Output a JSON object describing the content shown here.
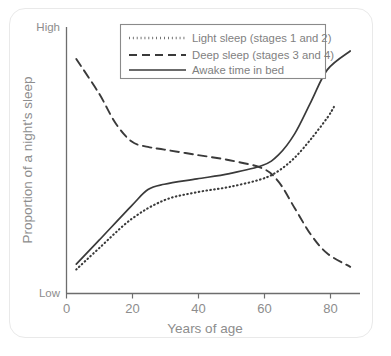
{
  "chart_data": {
    "type": "line",
    "title": "",
    "subtitle": "",
    "xlabel": "Years of age",
    "ylabel": "Proportion of a night's sleep",
    "xlim": [
      0,
      90
    ],
    "ylim": [
      0,
      100
    ],
    "grid": false,
    "legend_position": "top-center",
    "x_tick_labels": [
      "0",
      "20",
      "40",
      "60",
      "80"
    ],
    "x_tick_values": [
      0,
      20,
      40,
      60,
      80
    ],
    "y_tick_labels": [
      "Low",
      "High"
    ],
    "y_tick_values": [
      0,
      100
    ],
    "y_axis_note": "Qualitative axis labelled only Low (bottom) and High (top)",
    "series": [
      {
        "name": "Light sleep (stages 1 and 2)",
        "style": "dotted",
        "color": "#3a3a3a",
        "x": [
          3,
          10,
          20,
          30,
          40,
          50,
          60,
          65,
          70,
          75,
          80,
          82
        ],
        "values": [
          9,
          17,
          28,
          35,
          38,
          40,
          43,
          46,
          51,
          58,
          66,
          70
        ]
      },
      {
        "name": "Deep sleep (stages 3 and 4)",
        "style": "dashed",
        "color": "#3a3a3a",
        "x": [
          3,
          10,
          15,
          20,
          25,
          30,
          40,
          50,
          60,
          65,
          70,
          75,
          80,
          87
        ],
        "values": [
          88,
          75,
          64,
          57,
          55,
          54,
          52,
          50,
          47,
          42,
          32,
          22,
          15,
          10
        ]
      },
      {
        "name": "Awake time in bed",
        "style": "solid",
        "color": "#3a3a3a",
        "x": [
          3,
          10,
          20,
          25,
          30,
          40,
          50,
          60,
          65,
          70,
          75,
          80,
          87
        ],
        "values": [
          11,
          20,
          33,
          39,
          41,
          43,
          45,
          48,
          52,
          60,
          72,
          84,
          91
        ]
      }
    ]
  },
  "axes": {
    "y_top_label": "High",
    "y_bottom_label": "Low",
    "y_title": "Proportion of a night's sleep",
    "x_title": "Years of age",
    "x_ticks": [
      "0",
      "20",
      "40",
      "60",
      "80"
    ]
  },
  "legend": {
    "entries": [
      {
        "label": "Light sleep (stages 1 and 2)",
        "style": "dotted"
      },
      {
        "label": "Deep sleep (stages 3 and 4)",
        "style": "dashed"
      },
      {
        "label": "Awake time in bed",
        "style": "solid"
      }
    ]
  },
  "colors": {
    "line": "#3a3a3a",
    "axis": "#6d6d6d",
    "text": "#8d8d8d",
    "frame": "#e9e9e9",
    "legend_border": "#8a8a8a",
    "background": "#ffffff"
  }
}
